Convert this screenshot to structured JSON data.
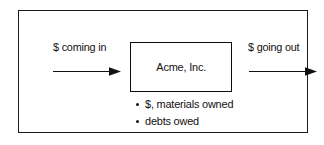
{
  "diagram": {
    "entity": {
      "name": "Acme, Inc."
    },
    "inflow": {
      "label": "$ coming in",
      "arrow_icon": "arrow-right-icon",
      "direction": "right"
    },
    "outflow": {
      "label": "$ going out",
      "arrow_icon": "arrow-right-icon",
      "direction": "right"
    },
    "holdings": [
      {
        "text": "$, materials owned",
        "bullet_icon": "bullet-dot-icon"
      },
      {
        "text": "debts owed",
        "bullet_icon": "bullet-dot-icon"
      }
    ],
    "colors": {
      "stroke": "#111111",
      "background": "#ffffff",
      "frame": "#1a1a1a"
    }
  }
}
